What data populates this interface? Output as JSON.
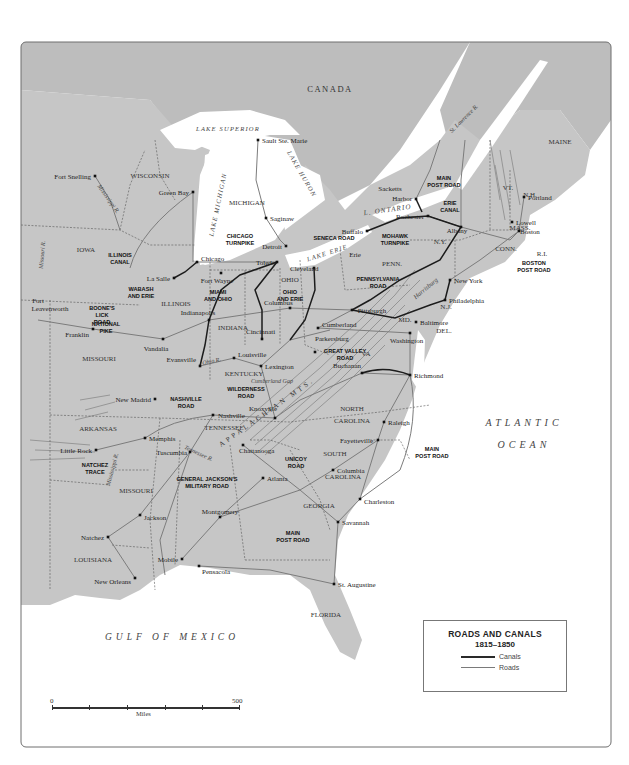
{
  "colors": {
    "land": "#c6c6c6",
    "canada_land": "#bdbdbd",
    "water": "#ffffff",
    "border": "#555555",
    "canal": "#1c1c1c",
    "road": "#7c7c7c",
    "mountains": "#8a8a8a",
    "frame": "#6e6e6e"
  },
  "legend": {
    "title": "ROADS AND CANALS",
    "years": "1815–1850",
    "items": [
      {
        "type": "canal",
        "label": "Canals"
      },
      {
        "type": "road",
        "label": "Roads"
      }
    ]
  },
  "scale": {
    "start": "0",
    "end": "500",
    "unit": "Miles"
  },
  "regions": {
    "countries": [
      {
        "label": "CANADA",
        "x": 330,
        "y": 92
      }
    ],
    "water_bodies": [
      {
        "label": "LAKE SUPERIOR",
        "x": 228,
        "y": 131,
        "rotate": 0,
        "size": 6.5
      },
      {
        "label": "LAKE MICHIGAN",
        "x": 220,
        "y": 205,
        "rotate": -78,
        "size": 6.5
      },
      {
        "label": "LAKE HURON",
        "x": 300,
        "y": 175,
        "rotate": 60,
        "size": 6.5
      },
      {
        "label": "L. ONTARIO",
        "x": 388,
        "y": 212,
        "rotate": -8,
        "size": 7
      },
      {
        "label": "LAKE ERIE",
        "x": 328,
        "y": 255,
        "rotate": -18,
        "size": 6.5
      },
      {
        "label": "ATLANTIC",
        "x": 524,
        "y": 426,
        "rotate": 0,
        "size": 10
      },
      {
        "label": "OCEAN",
        "x": 524,
        "y": 448,
        "rotate": 0,
        "size": 10
      },
      {
        "label": "GULF OF MEXICO",
        "x": 172,
        "y": 640,
        "rotate": 0,
        "size": 9.5
      }
    ],
    "rivers": [
      {
        "label": "St. Lawrence R.",
        "x": 465,
        "y": 120,
        "rotate": -45,
        "size": 6
      },
      {
        "label": "Mississippi R.",
        "x": 107,
        "y": 200,
        "rotate": 55,
        "size": 6
      },
      {
        "label": "Missouri R.",
        "x": 44,
        "y": 255,
        "rotate": -85,
        "size": 6
      },
      {
        "label": "Ohio R.",
        "x": 212,
        "y": 363,
        "rotate": -12,
        "size": 6
      },
      {
        "label": "Tennessee R.",
        "x": 198,
        "y": 455,
        "rotate": 25,
        "size": 6
      },
      {
        "label": "Mississippi R.",
        "x": 114,
        "y": 470,
        "rotate": -75,
        "size": 6
      },
      {
        "label": "Harrisburg",
        "x": 427,
        "y": 290,
        "rotate": -40,
        "size": 6.5
      },
      {
        "label": "Cumberland Gap",
        "x": 272,
        "y": 383,
        "rotate": 0,
        "size": 6
      }
    ],
    "mountains": [
      {
        "label": "APPALACHIAN MTS.",
        "x": 268,
        "y": 414,
        "rotate": -35,
        "size": 7
      }
    ],
    "states": [
      {
        "label": "WISCONSIN",
        "x": 150,
        "y": 178
      },
      {
        "label": "MICHIGAN",
        "x": 247,
        "y": 205
      },
      {
        "label": "IOWA",
        "x": 86,
        "y": 252
      },
      {
        "label": "ILLINOIS",
        "x": 176,
        "y": 306
      },
      {
        "label": "INDIANA",
        "x": 233,
        "y": 330
      },
      {
        "label": "OHIO",
        "x": 290,
        "y": 282
      },
      {
        "label": "MISSOURI",
        "x": 99,
        "y": 361
      },
      {
        "label": "KENTUCKY",
        "x": 244,
        "y": 376
      },
      {
        "label": "TENNESSEE",
        "x": 224,
        "y": 430
      },
      {
        "label": "ARKANSAS",
        "x": 98,
        "y": 431
      },
      {
        "label": "MISSOURI",
        "x": 136,
        "y": 493
      },
      {
        "label": "GEORGIA",
        "x": 319,
        "y": 508
      },
      {
        "label": "LOUISIANA",
        "x": 93,
        "y": 562
      },
      {
        "label": "FLORIDA",
        "x": 326,
        "y": 617
      },
      {
        "label": "NORTH",
        "x": 352,
        "y": 411
      },
      {
        "label": "CAROLINA",
        "x": 352,
        "y": 423
      },
      {
        "label": "SOUTH",
        "x": 335,
        "y": 456
      },
      {
        "label": "CAROLINA",
        "x": 343,
        "y": 479
      },
      {
        "label": "VA",
        "x": 366,
        "y": 356
      },
      {
        "label": "MD.",
        "x": 405,
        "y": 322
      },
      {
        "label": "DEL.",
        "x": 444,
        "y": 333
      },
      {
        "label": "N.J.",
        "x": 446,
        "y": 309
      },
      {
        "label": "PENN.",
        "x": 392,
        "y": 266
      },
      {
        "label": "N.Y.",
        "x": 440,
        "y": 244
      },
      {
        "label": "CONN.",
        "x": 506,
        "y": 251
      },
      {
        "label": "MASS.",
        "x": 520,
        "y": 230
      },
      {
        "label": "R.I.",
        "x": 542,
        "y": 256
      },
      {
        "label": "N.H.",
        "x": 530,
        "y": 197
      },
      {
        "label": "VT.",
        "x": 508,
        "y": 190
      },
      {
        "label": "MAINE",
        "x": 560,
        "y": 144
      }
    ]
  },
  "cities": [
    {
      "name": "Sault Ste. Marie",
      "x": 258,
      "y": 140,
      "lx": 262,
      "ly": 143,
      "anchor": "start"
    },
    {
      "name": "Fort Snelling",
      "x": 95,
      "y": 176,
      "lx": 91,
      "ly": 179,
      "anchor": "end"
    },
    {
      "name": "Green Bay",
      "x": 193,
      "y": 192,
      "lx": 189,
      "ly": 195,
      "anchor": "end"
    },
    {
      "name": "Saginaw",
      "x": 266,
      "y": 218,
      "lx": 270,
      "ly": 221,
      "anchor": "start"
    },
    {
      "name": "Sacketts",
      "x": 0,
      "y": 0,
      "lx": 390,
      "ly": 191,
      "anchor": "middle",
      "nodot": true
    },
    {
      "name": "Harbor",
      "x": 416,
      "y": 199,
      "lx": 412,
      "ly": 201,
      "anchor": "end"
    },
    {
      "name": "Rochester",
      "x": 428,
      "y": 216,
      "lx": 424,
      "ly": 219,
      "anchor": "end"
    },
    {
      "name": "Buffalo",
      "x": 367,
      "y": 231,
      "lx": 363,
      "ly": 234,
      "anchor": "end"
    },
    {
      "name": "Albany",
      "x": 461,
      "y": 227,
      "lx": 457,
      "ly": 233,
      "anchor": "middle"
    },
    {
      "name": "Portland",
      "x": 524,
      "y": 197,
      "lx": 528,
      "ly": 200,
      "anchor": "start"
    },
    {
      "name": "Lowell",
      "x": 512,
      "y": 222,
      "lx": 516,
      "ly": 225,
      "anchor": "start"
    },
    {
      "name": "Boston",
      "x": 519,
      "y": 231,
      "lx": 520,
      "ly": 234,
      "anchor": "start"
    },
    {
      "name": "Detroit",
      "x": 286,
      "y": 246,
      "lx": 282,
      "ly": 249,
      "anchor": "end"
    },
    {
      "name": "Chicago",
      "x": 197,
      "y": 262,
      "lx": 201,
      "ly": 261,
      "anchor": "start"
    },
    {
      "name": "Toledo",
      "x": 277,
      "y": 262,
      "lx": 256,
      "ly": 265,
      "anchor": "start"
    },
    {
      "name": "Erie",
      "x": 0,
      "y": 0,
      "lx": 355,
      "ly": 257,
      "anchor": "middle",
      "nodot": true
    },
    {
      "name": "Cleveland",
      "x": 314,
      "y": 268,
      "lx": 290,
      "ly": 271,
      "anchor": "start"
    },
    {
      "name": "La Salle",
      "x": 174,
      "y": 278,
      "lx": 170,
      "ly": 281,
      "anchor": "end"
    },
    {
      "name": "Fort Wayne",
      "x": 221,
      "y": 273,
      "lx": 217,
      "ly": 283,
      "anchor": "middle"
    },
    {
      "name": "New York",
      "x": 450,
      "y": 280,
      "lx": 454,
      "ly": 283,
      "anchor": "start"
    },
    {
      "name": "Fort",
      "x": 0,
      "y": 0,
      "lx": 38,
      "ly": 303,
      "anchor": "middle",
      "nodot": true
    },
    {
      "name": "Leavenworth",
      "x": 0,
      "y": 0,
      "lx": 50,
      "ly": 311,
      "anchor": "middle",
      "nodot": true
    },
    {
      "name": "Columbus",
      "x": 290,
      "y": 308,
      "lx": 264,
      "ly": 305,
      "anchor": "start"
    },
    {
      "name": "Philadelphia",
      "x": 445,
      "y": 300,
      "lx": 449,
      "ly": 303,
      "anchor": "start"
    },
    {
      "name": "Indianapolis",
      "x": 209,
      "y": 320,
      "lx": 198,
      "ly": 315,
      "anchor": "middle"
    },
    {
      "name": "Pittsburgh",
      "x": 352,
      "y": 310,
      "lx": 372,
      "ly": 313,
      "anchor": "middle"
    },
    {
      "name": "Franklin",
      "x": 93,
      "y": 329,
      "lx": 89,
      "ly": 337,
      "anchor": "end"
    },
    {
      "name": "Cincinnati",
      "x": 262,
      "y": 339,
      "lx": 246,
      "ly": 334,
      "anchor": "start"
    },
    {
      "name": "Cumberland",
      "x": 318,
      "y": 328,
      "lx": 322,
      "ly": 327,
      "anchor": "start"
    },
    {
      "name": "Baltimore",
      "x": 416,
      "y": 322,
      "lx": 420,
      "ly": 325,
      "anchor": "start"
    },
    {
      "name": "Vandalia",
      "x": 163,
      "y": 339,
      "lx": 156,
      "ly": 351,
      "anchor": "middle"
    },
    {
      "name": "Parkersburg",
      "x": 315,
      "y": 352,
      "lx": 315,
      "ly": 341,
      "anchor": "start"
    },
    {
      "name": "Washington",
      "x": 410,
      "y": 333,
      "lx": 390,
      "ly": 343,
      "anchor": "start"
    },
    {
      "name": "Louisville",
      "x": 234,
      "y": 358,
      "lx": 238,
      "ly": 357,
      "anchor": "start"
    },
    {
      "name": "Evansville",
      "x": 200,
      "y": 366,
      "lx": 196,
      "ly": 362,
      "anchor": "end"
    },
    {
      "name": "Lexington",
      "x": 261,
      "y": 366,
      "lx": 265,
      "ly": 369,
      "anchor": "start"
    },
    {
      "name": "Buchanan",
      "x": 362,
      "y": 373,
      "lx": 347,
      "ly": 368,
      "anchor": "middle"
    },
    {
      "name": "Richmond",
      "x": 410,
      "y": 375,
      "lx": 414,
      "ly": 378,
      "anchor": "start"
    },
    {
      "name": "New Madrid",
      "x": 155,
      "y": 399,
      "lx": 151,
      "ly": 402,
      "anchor": "end"
    },
    {
      "name": "Nashville",
      "x": 213,
      "y": 415,
      "lx": 218,
      "ly": 418,
      "anchor": "start"
    },
    {
      "name": "Knoxville",
      "x": 275,
      "y": 418,
      "lx": 263,
      "ly": 411,
      "anchor": "middle"
    },
    {
      "name": "Raleigh",
      "x": 384,
      "y": 422,
      "lx": 388,
      "ly": 425,
      "anchor": "start"
    },
    {
      "name": "Memphis",
      "x": 145,
      "y": 438,
      "lx": 149,
      "ly": 441,
      "anchor": "start"
    },
    {
      "name": "Little Rock",
      "x": 96,
      "y": 450,
      "lx": 92,
      "ly": 453,
      "anchor": "end"
    },
    {
      "name": "Fayetteville",
      "x": 378,
      "y": 440,
      "lx": 373,
      "ly": 443,
      "anchor": "end"
    },
    {
      "name": "Tuscumbia",
      "x": 190,
      "y": 452,
      "lx": 187,
      "ly": 455,
      "anchor": "end"
    },
    {
      "name": "Chattanooga",
      "x": 243,
      "y": 445,
      "lx": 239,
      "ly": 453,
      "anchor": "start"
    },
    {
      "name": "Columbia",
      "x": 333,
      "y": 470,
      "lx": 337,
      "ly": 473,
      "anchor": "start"
    },
    {
      "name": "Atlanta",
      "x": 263,
      "y": 478,
      "lx": 267,
      "ly": 481,
      "anchor": "start"
    },
    {
      "name": "Charleston",
      "x": 360,
      "y": 499,
      "lx": 364,
      "ly": 504,
      "anchor": "start"
    },
    {
      "name": "Jackson",
      "x": 140,
      "y": 515,
      "lx": 144,
      "ly": 520,
      "anchor": "start"
    },
    {
      "name": "Montgomery",
      "x": 220,
      "y": 517,
      "lx": 220,
      "ly": 514,
      "anchor": "middle"
    },
    {
      "name": "Natchez",
      "x": 108,
      "y": 537,
      "lx": 104,
      "ly": 540,
      "anchor": "end"
    },
    {
      "name": "Savannah",
      "x": 338,
      "y": 522,
      "lx": 342,
      "ly": 525,
      "anchor": "start"
    },
    {
      "name": "Mobile",
      "x": 182,
      "y": 559,
      "lx": 178,
      "ly": 562,
      "anchor": "end"
    },
    {
      "name": "Pensacola",
      "x": 199,
      "y": 566,
      "lx": 202,
      "ly": 574,
      "anchor": "start"
    },
    {
      "name": "New Orleans",
      "x": 135,
      "y": 578,
      "lx": 131,
      "ly": 584,
      "anchor": "end"
    },
    {
      "name": "St. Augustine",
      "x": 334,
      "y": 584,
      "lx": 338,
      "ly": 587,
      "anchor": "start"
    }
  ],
  "routes": [
    {
      "lines": [
        "ILLINOIS",
        "CANAL"
      ],
      "x": 120,
      "y": 257
    },
    {
      "lines": [
        "CHICAGO",
        "TURNPIKE"
      ],
      "x": 240,
      "y": 238
    },
    {
      "lines": [
        "SENECA ROAD"
      ],
      "x": 334,
      "y": 240
    },
    {
      "lines": [
        "MOHAWK",
        "TURNPIKE"
      ],
      "x": 395,
      "y": 238
    },
    {
      "lines": [
        "MAIN",
        "POST ROAD"
      ],
      "x": 444,
      "y": 180
    },
    {
      "lines": [
        "ERIE",
        "CANAL"
      ],
      "x": 450,
      "y": 205
    },
    {
      "lines": [
        "WABASH",
        "AND ERIE"
      ],
      "x": 141,
      "y": 291
    },
    {
      "lines": [
        "MIAMI",
        "AND OHIO"
      ],
      "x": 218,
      "y": 294
    },
    {
      "lines": [
        "OHIO",
        "AND ERIE"
      ],
      "x": 290,
      "y": 294
    },
    {
      "lines": [
        "PENNSYLVANIA",
        "ROAD"
      ],
      "x": 378,
      "y": 281
    },
    {
      "lines": [
        "BOSTON",
        "POST ROAD"
      ],
      "x": 534,
      "y": 265
    },
    {
      "lines": [
        "BOONE'S",
        "LICK",
        "ROAD"
      ],
      "x": 102,
      "y": 310
    },
    {
      "lines": [
        "NATIONAL",
        "PIKE"
      ],
      "x": 106,
      "y": 326
    },
    {
      "lines": [
        "GREAT VALLEY",
        "ROAD"
      ],
      "x": 345,
      "y": 353
    },
    {
      "lines": [
        "WILDERNESS",
        "ROAD"
      ],
      "x": 246,
      "y": 391
    },
    {
      "lines": [
        "NASHVILLE",
        "ROAD"
      ],
      "x": 186,
      "y": 401
    },
    {
      "lines": [
        "MAIN",
        "POST ROAD"
      ],
      "x": 432,
      "y": 451
    },
    {
      "lines": [
        "NATCHEZ",
        "TRACE"
      ],
      "x": 95,
      "y": 467
    },
    {
      "lines": [
        "UNICOY",
        "ROAD"
      ],
      "x": 296,
      "y": 461
    },
    {
      "lines": [
        "GENERAL JACKSON'S",
        "MILITARY ROAD"
      ],
      "x": 207,
      "y": 481
    },
    {
      "lines": [
        "MAIN",
        "POST ROAD"
      ],
      "x": 293,
      "y": 535
    }
  ]
}
